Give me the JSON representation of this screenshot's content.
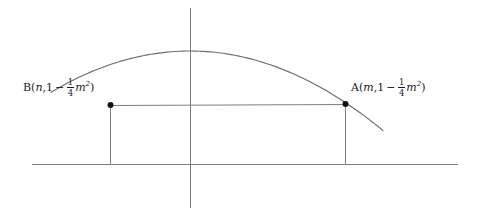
{
  "figure": {
    "background_color": "#ffffff",
    "line_color": "#808080",
    "text_color": "#1a1a1a",
    "point_color": "#111111"
  },
  "labels": {
    "point_b": {
      "name": "B",
      "open_paren": "(",
      "x_value": "n",
      "separator": ",",
      "one": "1",
      "minus": "−",
      "frac_num": "1",
      "frac_den": "4",
      "variable": "m",
      "exponent": "2",
      "close_paren": ")",
      "full_text": "B(n,1−¼m²)"
    },
    "point_a": {
      "name": "A",
      "open_paren": "(",
      "x_value": "m",
      "separator": ",",
      "one": "1",
      "minus": "−",
      "frac_num": "1",
      "frac_den": "4",
      "variable": "m",
      "exponent": "2",
      "close_paren": ")",
      "full_text": "A(m,1−¼m²)"
    }
  },
  "chart_data": {
    "type": "line",
    "title": "",
    "xlabel": "",
    "ylabel": "",
    "grid": false,
    "legend": null,
    "annotations": [
      "B(n,1−¼m²)",
      "A(m,1−¼m²)"
    ],
    "axes": {
      "x_axis": {
        "y_pixel": 164,
        "x_start_pixel": 32,
        "x_end_pixel": 458
      },
      "y_axis": {
        "x_pixel": 190,
        "y_start_pixel": 8,
        "y_end_pixel": 208
      },
      "origin_pixel": [
        190,
        164
      ]
    },
    "series": [
      {
        "name": "parabola",
        "kind": "curve",
        "description": "downward opening parabola y = 1 - (1/4)x^2 scaled to pixels",
        "vertex_pixel": [
          190,
          51
        ],
        "root_left_pixel": [
          75,
          164
        ],
        "root_right_pixel": [
          420,
          164
        ],
        "path_points_pixel": [
          [
            52,
            213
          ],
          [
            61,
            191
          ],
          [
            70,
            172
          ],
          [
            75,
            164
          ],
          [
            85,
            146
          ],
          [
            96,
            128
          ],
          [
            110,
            105
          ],
          [
            125,
            87
          ],
          [
            140,
            72
          ],
          [
            155,
            61
          ],
          [
            170,
            54
          ],
          [
            190,
            51
          ],
          [
            210,
            53
          ],
          [
            230,
            60
          ],
          [
            250,
            70
          ],
          [
            270,
            83
          ],
          [
            290,
            98
          ],
          [
            310,
            116
          ],
          [
            330,
            136
          ],
          [
            345,
            104
          ],
          [
            360,
            152
          ],
          [
            380,
            177
          ],
          [
            400,
            160
          ],
          [
            420,
            164
          ],
          [
            440,
            191
          ],
          [
            462,
            217
          ]
        ]
      },
      {
        "name": "rectangle",
        "kind": "rect",
        "description": "rectangle inscribed under parabola between B and A down to x-axis",
        "top_left_pixel": [
          110,
          105
        ],
        "top_right_pixel": [
          345,
          104
        ],
        "bottom_left_pixel": [
          110,
          164
        ],
        "bottom_right_pixel": [
          345,
          164
        ]
      }
    ],
    "points": [
      {
        "label": "B",
        "pixel": [
          110,
          105
        ],
        "x_symbol": "n",
        "y_symbol": "1−¼m²"
      },
      {
        "label": "A",
        "pixel": [
          345,
          104
        ],
        "x_symbol": "m",
        "y_symbol": "1−¼m²"
      }
    ]
  }
}
